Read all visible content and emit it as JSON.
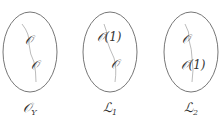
{
  "panels": [
    {
      "label_main": "𝒪",
      "label_sub": "Y",
      "node1": "𝒪",
      "node2": "𝒪"
    },
    {
      "label_main": "ℒ",
      "label_sub": "1",
      "node1": "𝒪(1)",
      "node2": "𝒪"
    },
    {
      "label_main": "ℒ",
      "label_sub": "2",
      "node1": "𝒪",
      "node2": "𝒪(1)"
    }
  ],
  "colors": {
    "ellipse": "#777777",
    "curve": "#999999",
    "text": "#333333"
  }
}
